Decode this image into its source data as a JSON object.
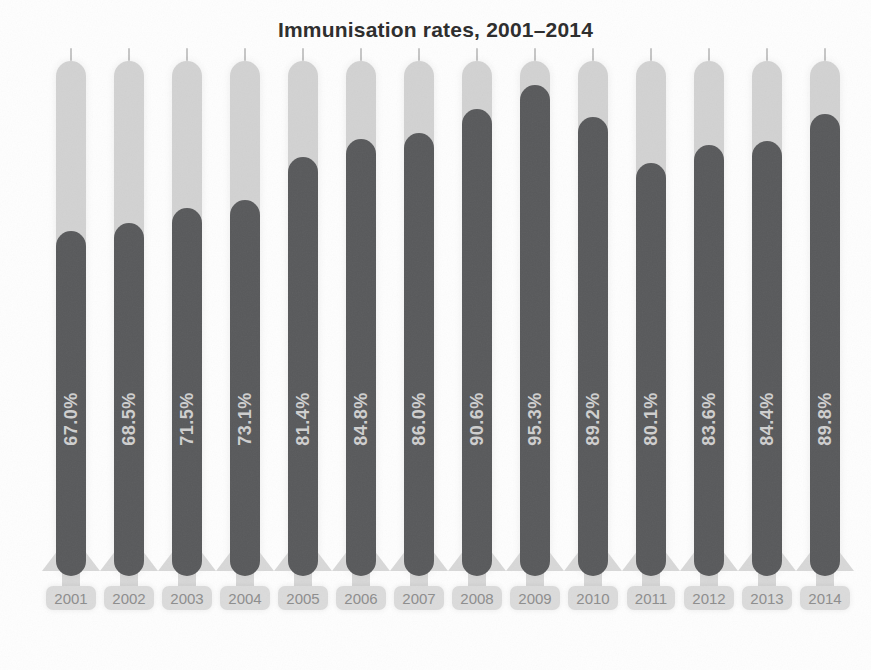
{
  "title": "Immunisation rates, 2001–2014",
  "chart_data": {
    "type": "bar",
    "title": "Immunisation rates, 2001–2014",
    "xlabel": "",
    "ylabel": "",
    "ylim": [
      0,
      100
    ],
    "legend": null,
    "grid": false,
    "categories": [
      "2001",
      "2002",
      "2003",
      "2004",
      "2005",
      "2006",
      "2007",
      "2008",
      "2009",
      "2010",
      "2011",
      "2012",
      "2013",
      "2014"
    ],
    "values": [
      67.0,
      68.5,
      71.5,
      73.1,
      81.4,
      84.8,
      86.0,
      90.6,
      95.3,
      89.2,
      80.1,
      83.6,
      84.4,
      89.8
    ],
    "value_labels": [
      "67.0%",
      "68.5%",
      "71.5%",
      "73.1%",
      "81.4%",
      "84.8%",
      "86.0%",
      "90.6%",
      "95.3%",
      "89.2%",
      "80.1%",
      "83.6%",
      "84.4%",
      "89.8%"
    ],
    "colors": {
      "bar_fill": "#58595b",
      "bar_track": "#d2d2d2",
      "bar_base": "#d8d8d8",
      "value_label_text": "#cfcfcf",
      "year_pill_bg": "#dbdbdb",
      "year_text": "#8d8d8d",
      "title_text": "#2b2b2b",
      "tick": "#c6c6c6",
      "background": "#fefefe"
    }
  }
}
